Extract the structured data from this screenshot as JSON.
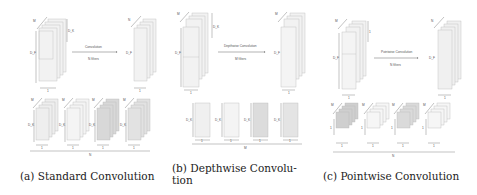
{
  "panels": [
    {
      "id": "standard",
      "caption": "(a) Standard Convolution",
      "operation_label": "Convolution",
      "filters_label": "N filters",
      "input_labels": {
        "depth": "M",
        "kernel": "D_K",
        "height": "D_F",
        "width": "1"
      },
      "output_labels": {
        "depth": "N",
        "height": "D_F",
        "width": "1"
      },
      "filters": {
        "count_label": "N",
        "depth_label": "M",
        "height_label": "D_K",
        "width_label": "1",
        "shades": [
          "#eeeeee",
          "#f4f4f4",
          "#d8d8d8",
          "#e2e2e2"
        ]
      }
    },
    {
      "id": "depthwise",
      "caption_line1": "(b)  Depthwise  Convolu-",
      "caption_line2": "tion",
      "operation_label": "Depthwise Convolution",
      "filters_label": "M filters",
      "input_labels": {
        "depth": "M",
        "kernel": "D_K",
        "height": "D_F",
        "width": "1"
      },
      "output_labels": {
        "depth": "M",
        "height": "D_F",
        "width": "1"
      },
      "filters": {
        "count_label": "M",
        "height_label": "D_K",
        "width_label": "1",
        "shades": [
          "#f0f0f0",
          "#f4f4f4",
          "#dcdcdc",
          "#e4e4e4"
        ]
      }
    },
    {
      "id": "pointwise",
      "caption": "(c) Pointwise Convolution",
      "operation_label": "Pointwise Convolution",
      "filters_label": "N filters",
      "input_labels": {
        "depth": "M",
        "kernel": "1",
        "height": "D_F",
        "width": "1"
      },
      "output_labels": {
        "depth": "N",
        "height": "D_F",
        "width": "1"
      },
      "filters": {
        "count_label": "N",
        "depth_label": "M",
        "height_label": "1",
        "width_label": "1",
        "shades": [
          "#cfcfcf",
          "#f6f6f6",
          "#dadada",
          "#f6f6f6"
        ]
      }
    }
  ]
}
